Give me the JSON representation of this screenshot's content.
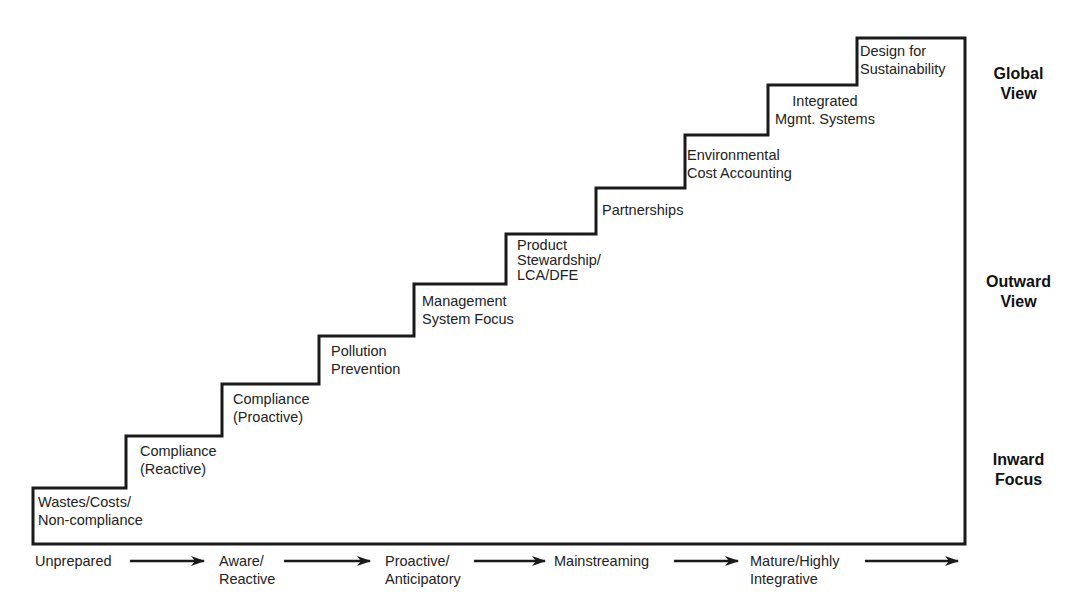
{
  "diagram": {
    "title": "",
    "steps": [
      {
        "lines": [
          "Wastes/Costs/",
          "Non-compliance"
        ]
      },
      {
        "lines": [
          "Compliance",
          "(Reactive)"
        ]
      },
      {
        "lines": [
          "Compliance",
          "(Proactive)"
        ]
      },
      {
        "lines": [
          "Pollution",
          "Prevention"
        ]
      },
      {
        "lines": [
          "Management",
          "System Focus"
        ]
      },
      {
        "lines": [
          "Product",
          "Stewardship/",
          "LCA/DFE"
        ]
      },
      {
        "lines": [
          "Partnerships"
        ]
      },
      {
        "lines": [
          "Environmental",
          "Cost Accounting"
        ]
      },
      {
        "lines": [
          "Integrated",
          "Mgmt. Systems"
        ]
      },
      {
        "lines": [
          "Design for",
          "Sustainability"
        ]
      }
    ],
    "side_labels": [
      {
        "lines": [
          "Global",
          "View"
        ]
      },
      {
        "lines": [
          "Outward",
          "View"
        ]
      },
      {
        "lines": [
          "Inward",
          "Focus"
        ]
      }
    ],
    "stages": [
      {
        "lines": [
          "Unprepared"
        ]
      },
      {
        "lines": [
          "Aware/",
          "Reactive"
        ]
      },
      {
        "lines": [
          "Proactive/",
          "Anticipatory"
        ]
      },
      {
        "lines": [
          "Mainstreaming"
        ]
      },
      {
        "lines": [
          "Mature/Highly",
          "Integrative"
        ]
      }
    ],
    "colors": {
      "line": "#1a1a1a",
      "background": "#ffffff",
      "text": "#222222"
    }
  }
}
